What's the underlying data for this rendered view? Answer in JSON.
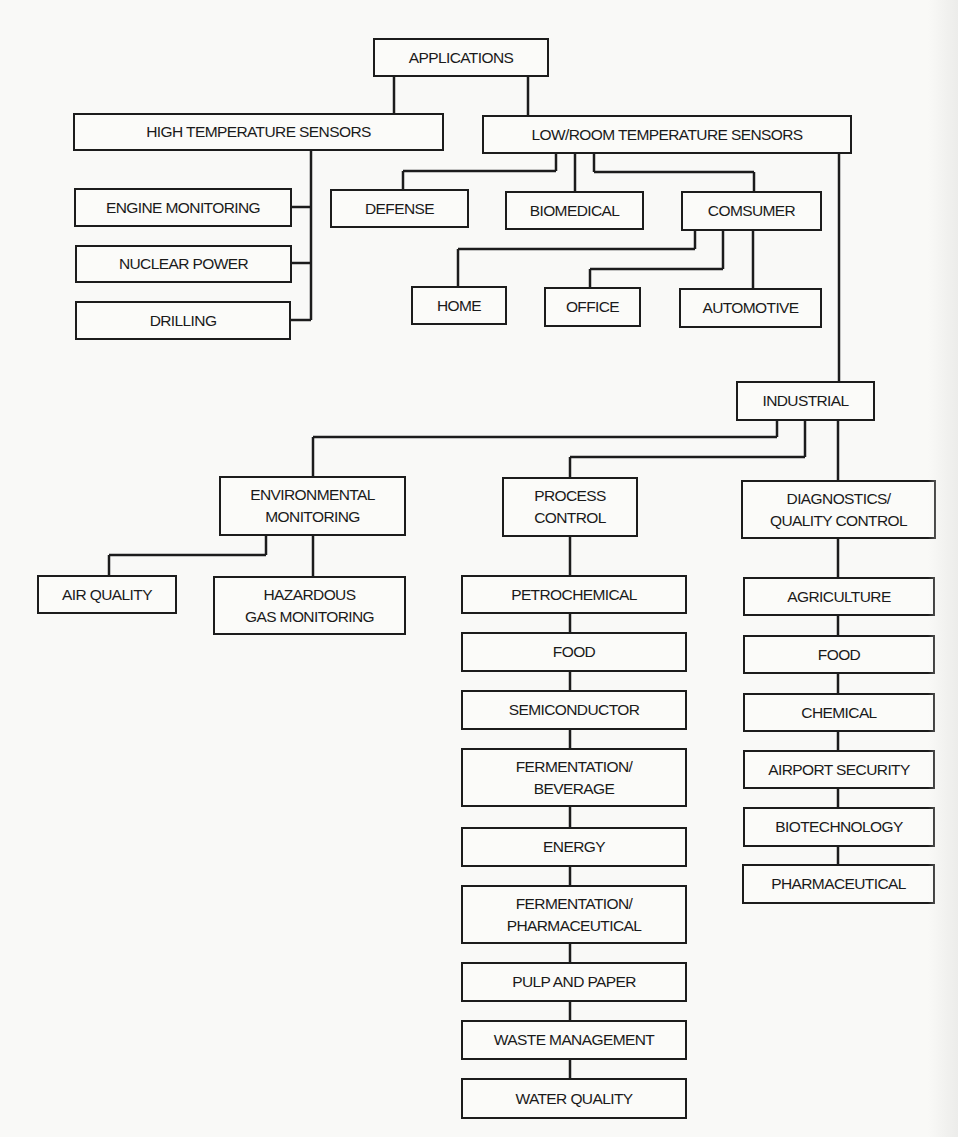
{
  "diagram": {
    "root": {
      "label": "APPLICATIONS"
    },
    "high_temp": {
      "label": "HIGH TEMPERATURE SENSORS",
      "children": [
        "ENGINE MONITORING",
        "NUCLEAR POWER",
        "DRILLING"
      ]
    },
    "low_temp": {
      "label": "LOW/ROOM TEMPERATURE SENSORS",
      "children": {
        "defense": "DEFENSE",
        "biomedical": "BIOMEDICAL",
        "consumer": {
          "label": "COMSUMER",
          "children": [
            "HOME",
            "OFFICE",
            "AUTOMOTIVE"
          ]
        },
        "industrial": {
          "label": "INDUSTRIAL",
          "environmental": {
            "line1": "ENVIRONMENTAL",
            "line2": "MONITORING",
            "children": {
              "air_quality": "AIR QUALITY",
              "hazardous": {
                "line1": "HAZARDOUS",
                "line2": "GAS MONITORING"
              }
            }
          },
          "process": {
            "line1": "PROCESS",
            "line2": "CONTROL",
            "children": [
              {
                "line1": "PETROCHEMICAL"
              },
              {
                "line1": "FOOD"
              },
              {
                "line1": "SEMICONDUCTOR"
              },
              {
                "line1": "FERMENTATION/",
                "line2": "BEVERAGE"
              },
              {
                "line1": "ENERGY"
              },
              {
                "line1": "FERMENTATION/",
                "line2": "PHARMACEUTICAL"
              },
              {
                "line1": "PULP AND PAPER"
              },
              {
                "line1": "WASTE MANAGEMENT"
              },
              {
                "line1": "WATER QUALITY"
              }
            ]
          },
          "diagnostics": {
            "line1": "DIAGNOSTICS/",
            "line2": "QUALITY CONTROL",
            "children": [
              "AGRICULTURE",
              "FOOD",
              "CHEMICAL",
              "AIRPORT SECURITY",
              "BIOTECHNOLOGY",
              "PHARMACEUTICAL"
            ]
          }
        }
      }
    }
  },
  "colors": {
    "line": "#1c1c1c",
    "background": "#f9f9f7",
    "box_fill": "#fbfbf9"
  }
}
